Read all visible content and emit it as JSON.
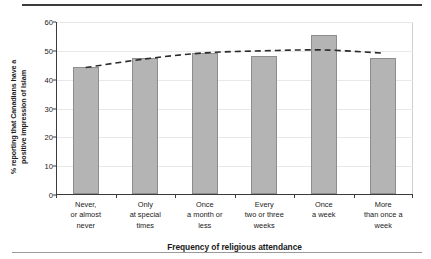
{
  "chart_data": {
    "type": "bar",
    "title": "",
    "xlabel": "Frequency of religious attendance",
    "ylabel": "% reporting that Canadians have a positive impression of Islam",
    "ylabel_lines": [
      "% reporting that Canadians have a",
      "positive impression of Islam"
    ],
    "categories": [
      "Never, or almost never",
      "Only at special times",
      "Once a month or less",
      "Every two or three weeks",
      "Once a week",
      "More than once a week"
    ],
    "category_lines": [
      [
        "Never,",
        "or almost",
        "never"
      ],
      [
        "Only",
        "at special",
        "times"
      ],
      [
        "Once",
        "a month or",
        "less"
      ],
      [
        "Every",
        "two or three",
        "weeks"
      ],
      [
        "Once",
        "a week"
      ],
      [
        "More",
        "than once a",
        "week"
      ]
    ],
    "values": [
      44,
      47,
      49,
      48,
      55,
      47
    ],
    "series": [
      {
        "name": "% positive impression of Islam",
        "type": "bar",
        "values": [
          44,
          47,
          49,
          48,
          55,
          47
        ]
      },
      {
        "name": "trend",
        "type": "line",
        "style": "dashed",
        "values": [
          44.2,
          47.2,
          49.3,
          50.0,
          50.3,
          49.2
        ]
      }
    ],
    "ylim": [
      0,
      60
    ],
    "yticks": [
      0,
      10,
      20,
      30,
      40,
      50,
      60
    ],
    "ytick_labels": [
      "0",
      "10",
      "20",
      "30",
      "40",
      "50",
      "60"
    ],
    "grid": true,
    "legend": "none",
    "colors": {
      "bar_fill": "#b4b4b4",
      "bar_stroke": "#8d8d8d",
      "trend_line": "#2b2b2b",
      "axis": "#3b3b3b",
      "gridline": "#e8e8e8",
      "text": "#1a1a1a",
      "rule_top": "#3b3b3b",
      "rule_bottom": "#9a9a9a"
    }
  }
}
